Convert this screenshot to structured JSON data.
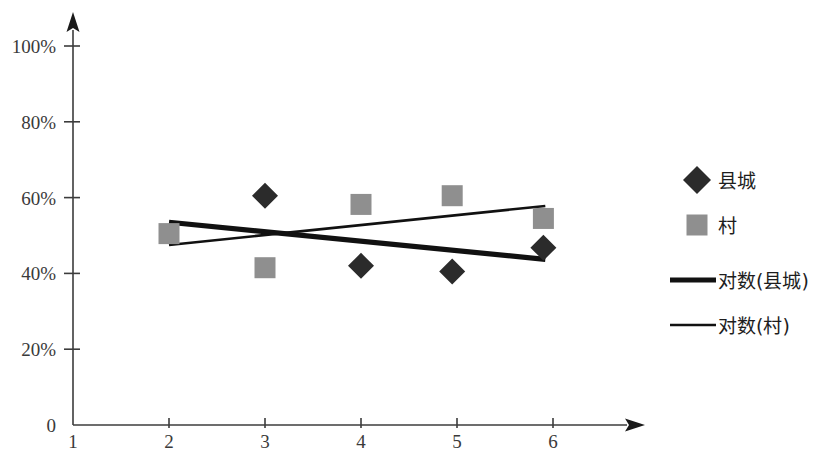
{
  "chart_data": {
    "type": "scatter",
    "title": "",
    "xlabel": "",
    "ylabel": "",
    "xlim": [
      1,
      6.6
    ],
    "ylim": [
      0,
      1.08
    ],
    "grid": false,
    "legend_position": "right",
    "x_ticks": [
      "1",
      "2",
      "3",
      "4",
      "5",
      "6"
    ],
    "x_tick_values": [
      1,
      2,
      3,
      4,
      5,
      6
    ],
    "y_ticks": [
      "0",
      "20%",
      "40%",
      "60%",
      "80%",
      "100%"
    ],
    "y_tick_values": [
      0,
      0.2,
      0.4,
      0.6,
      0.8,
      1.0
    ],
    "series": [
      {
        "name": "县城",
        "marker": "diamond",
        "color": "#2b2b2b",
        "points": [
          {
            "x": 3.0,
            "y": 0.605
          },
          {
            "x": 4.0,
            "y": 0.42
          },
          {
            "x": 4.95,
            "y": 0.405
          },
          {
            "x": 5.9,
            "y": 0.468
          }
        ]
      },
      {
        "name": "村",
        "marker": "square",
        "color": "#8f8f8f",
        "points": [
          {
            "x": 2.0,
            "y": 0.505
          },
          {
            "x": 3.0,
            "y": 0.415
          },
          {
            "x": 4.0,
            "y": 0.582
          },
          {
            "x": 4.95,
            "y": 0.605
          },
          {
            "x": 5.9,
            "y": 0.545
          }
        ]
      },
      {
        "name": "对数(县城)",
        "marker": "line-thick",
        "color": "#111111",
        "points": [
          {
            "x": 2.0,
            "y": 0.535
          },
          {
            "x": 5.92,
            "y": 0.437
          }
        ]
      },
      {
        "name": "对数(村)",
        "marker": "line-thin",
        "color": "#111111",
        "points": [
          {
            "x": 2.0,
            "y": 0.475
          },
          {
            "x": 5.92,
            "y": 0.578
          }
        ]
      }
    ]
  },
  "legend": {
    "items": [
      {
        "label": "县城",
        "marker": "diamond"
      },
      {
        "label": "村",
        "marker": "square"
      },
      {
        "label": "对数(县城)",
        "marker": "line-thick"
      },
      {
        "label": "对数(村)",
        "marker": "line-thin"
      }
    ]
  },
  "axis": {
    "y_arrow": "up-arrow-icon",
    "x_arrow": "right-arrow-icon"
  }
}
